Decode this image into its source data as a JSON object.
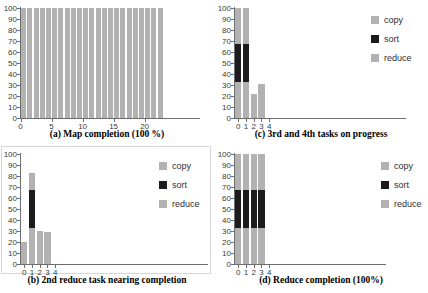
{
  "figure": {
    "background": "#ffffff",
    "description_visible_text_only": true
  },
  "palette": {
    "bar_gray": "#b2b2b2",
    "bar_black": "#1c1c1c",
    "axis_color": "#6e6e6e",
    "tick_text_color": "#3a3a3a",
    "caption_color": "#000000",
    "frame_color": "#d6d6d6"
  },
  "legend": {
    "position": "right",
    "items": [
      {
        "label": "copy",
        "color_key": "bar_gray"
      },
      {
        "label": "sort",
        "color_key": "bar_black"
      },
      {
        "label": "reduce",
        "color_key": "bar_gray"
      }
    ]
  },
  "chart_data": [
    {
      "id": "a",
      "type": "bar",
      "caption": "(a) Map completion (100 %)",
      "stacked": false,
      "grid": false,
      "ylim": [
        0,
        100
      ],
      "yticks": [
        0,
        10,
        20,
        30,
        40,
        50,
        60,
        70,
        80,
        90,
        100
      ],
      "xticks": [
        {
          "index": 0,
          "label": "0"
        },
        {
          "index": 5,
          "label": "5"
        },
        {
          "index": 10,
          "label": "10"
        },
        {
          "index": 15,
          "label": "15"
        },
        {
          "index": 20,
          "label": "20"
        }
      ],
      "segments": [
        "map"
      ],
      "segment_color_keys": [
        "bar_gray"
      ],
      "show_legend": false,
      "bars": [
        [
          100
        ],
        [
          100
        ],
        [
          100
        ],
        [
          100
        ],
        [
          100
        ],
        [
          100
        ],
        [
          100
        ],
        [
          100
        ],
        [
          100
        ],
        [
          100
        ],
        [
          100
        ],
        [
          100
        ],
        [
          100
        ],
        [
          100
        ],
        [
          100
        ],
        [
          100
        ],
        [
          100
        ],
        [
          100
        ],
        [
          100
        ],
        [
          100
        ],
        [
          100
        ],
        [
          100
        ],
        [
          100
        ]
      ]
    },
    {
      "id": "c",
      "type": "bar",
      "caption": "(c) 3rd and 4th tasks on progress",
      "stacked": true,
      "grid": false,
      "ylim": [
        0,
        100
      ],
      "yticks": [
        0,
        10,
        20,
        30,
        40,
        50,
        60,
        70,
        80,
        90,
        100
      ],
      "xticks": [
        {
          "index": 0,
          "label": "0"
        },
        {
          "index": 1,
          "label": "1"
        },
        {
          "index": 2,
          "label": "2"
        },
        {
          "index": 3,
          "label": "3"
        },
        {
          "index": 4,
          "label": "4"
        }
      ],
      "segments": [
        "copy",
        "sort",
        "reduce"
      ],
      "segment_color_keys": [
        "bar_gray",
        "bar_black",
        "bar_gray"
      ],
      "show_legend": true,
      "bars": [
        [
          33,
          34,
          33
        ],
        [
          33,
          34,
          33
        ],
        [
          22,
          0,
          0
        ],
        [
          31,
          0,
          0
        ],
        [
          0,
          0,
          0
        ]
      ]
    },
    {
      "id": "b",
      "type": "bar",
      "caption": "(b) 2nd reduce task nearing completion",
      "stacked": true,
      "grid": false,
      "ylim": [
        0,
        100
      ],
      "yticks": [
        0,
        10,
        20,
        30,
        40,
        50,
        60,
        70,
        80,
        90,
        100
      ],
      "xticks": [
        {
          "index": 0,
          "label": "0"
        },
        {
          "index": 1,
          "label": "1"
        },
        {
          "index": 2,
          "label": "2"
        },
        {
          "index": 3,
          "label": "3"
        },
        {
          "index": 4,
          "label": "4"
        }
      ],
      "segments": [
        "copy",
        "sort",
        "reduce"
      ],
      "segment_color_keys": [
        "bar_gray",
        "bar_black",
        "bar_gray"
      ],
      "show_legend": true,
      "bars": [
        [
          20,
          0,
          0
        ],
        [
          33,
          34,
          16
        ],
        [
          30,
          0,
          0
        ],
        [
          29,
          0,
          0
        ],
        [
          0,
          0,
          0
        ]
      ]
    },
    {
      "id": "d",
      "type": "bar",
      "caption": "(d) Reduce completion (100%)",
      "stacked": true,
      "grid": false,
      "ylim": [
        0,
        100
      ],
      "yticks": [
        0,
        10,
        20,
        30,
        40,
        50,
        60,
        70,
        80,
        90,
        100
      ],
      "xticks": [
        {
          "index": 0,
          "label": "0"
        },
        {
          "index": 1,
          "label": "1"
        },
        {
          "index": 2,
          "label": "2"
        },
        {
          "index": 3,
          "label": "3"
        },
        {
          "index": 4,
          "label": "4"
        }
      ],
      "segments": [
        "copy",
        "sort",
        "reduce"
      ],
      "segment_color_keys": [
        "bar_gray",
        "bar_black",
        "bar_gray"
      ],
      "show_legend": true,
      "bars": [
        [
          33,
          34,
          33
        ],
        [
          33,
          34,
          33
        ],
        [
          33,
          34,
          33
        ],
        [
          33,
          34,
          33
        ],
        [
          0,
          0,
          0
        ]
      ]
    }
  ]
}
